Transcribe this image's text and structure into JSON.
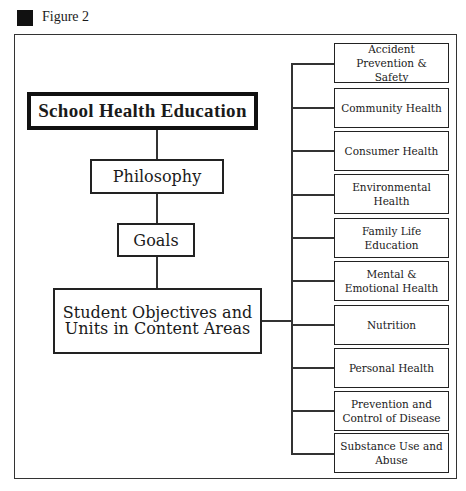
{
  "figure": {
    "label": "Figure 2"
  },
  "diagram": {
    "title": "School Health Education",
    "steps": [
      {
        "id": "philosophy",
        "label": "Philosophy"
      },
      {
        "id": "goals",
        "label": "Goals"
      },
      {
        "id": "objectives",
        "label": "Student Objectives and Units in Content Areas"
      }
    ],
    "content_areas": [
      "Accident Prevention & Safety",
      "Community Health",
      "Consumer Health",
      "Environmental Health",
      "Family Life Education",
      "Mental & Emotional Health",
      "Nutrition",
      "Personal Health",
      "Prevention and Control of Disease",
      "Substance Use and Abuse"
    ]
  }
}
